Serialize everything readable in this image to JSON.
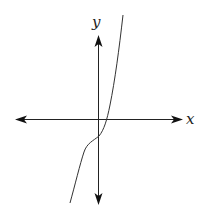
{
  "figure": {
    "type": "function-graph",
    "axes": {
      "x_label": "x",
      "y_label": "y"
    },
    "colors": {
      "axis": "#222222",
      "curve": "#333333",
      "background": "#ffffff"
    }
  }
}
